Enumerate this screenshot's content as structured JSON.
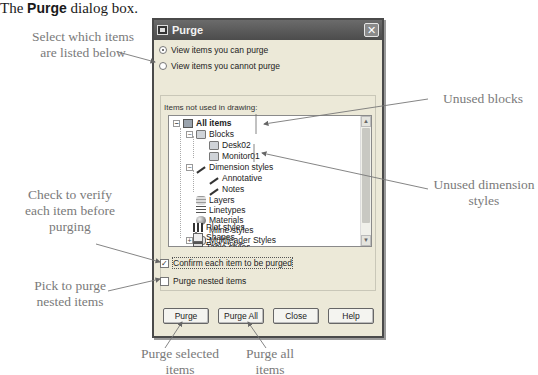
{
  "caption": {
    "prefix": "The ",
    "bold": "Purge",
    "suffix": " dialog box."
  },
  "dialog": {
    "title": "Purge",
    "close_label": "✕",
    "radios": [
      {
        "label": "View items you can purge",
        "selected": true
      },
      {
        "label": "View items you cannot purge",
        "selected": false
      }
    ],
    "group_label": "Items not used in drawing:",
    "tree": [
      {
        "label": "All items",
        "level": 0,
        "expander": "−",
        "icon": "all-items-icon",
        "bold": true
      },
      {
        "label": "Blocks",
        "level": 1,
        "expander": "−",
        "icon": "blocks-icon"
      },
      {
        "label": "Desk02",
        "level": 2,
        "icon": "block-icon"
      },
      {
        "label": "Monitor01",
        "level": 2,
        "icon": "block-icon"
      },
      {
        "label": "Dimension styles",
        "level": 1,
        "expander": "−",
        "icon": "dimension-style-icon"
      },
      {
        "label": "Annotative",
        "level": 2,
        "icon": "dimension-style-icon"
      },
      {
        "label": "Notes",
        "level": 2,
        "icon": "dimension-style-icon"
      },
      {
        "label": "Layers",
        "level": 1,
        "icon": "layers-icon"
      },
      {
        "label": "Linetypes",
        "level": 1,
        "icon": "linetypes-icon"
      },
      {
        "label": "Materials",
        "level": 1,
        "icon": "materials-icon"
      },
      {
        "label": "Mline styles",
        "level": 1,
        "icon": "mline-styles-icon"
      },
      {
        "label": "Multileader Styles",
        "level": 1,
        "expander": "+",
        "icon": "multileader-styles-icon"
      },
      {
        "label": "Plot styles",
        "level": 1,
        "icon": "plot-styles-icon"
      },
      {
        "label": "Shapes",
        "level": 1,
        "icon": "shapes-icon"
      },
      {
        "label": "Table styles",
        "level": 1,
        "icon": "table-styles-icon"
      }
    ],
    "scroll_up": "▲",
    "scroll_down": "▼",
    "confirm_checkbox": {
      "label": "Confirm each item to be purged",
      "checked": true,
      "mark": "✓"
    },
    "nested_checkbox": {
      "label": "Purge nested items",
      "checked": false
    },
    "buttons": {
      "purge": "Purge",
      "purge_all": "Purge All",
      "close": "Close",
      "help": "Help"
    }
  },
  "callouts": {
    "select_items": "Select which items are listed below",
    "unused_blocks": "Unused blocks",
    "unused_dimstyles": "Unused dimension styles",
    "verify": "Check to verify each item before purging",
    "nested": "Pick to purge nested items",
    "purge_selected": "Purge selected items",
    "purge_all": "Purge all items"
  }
}
